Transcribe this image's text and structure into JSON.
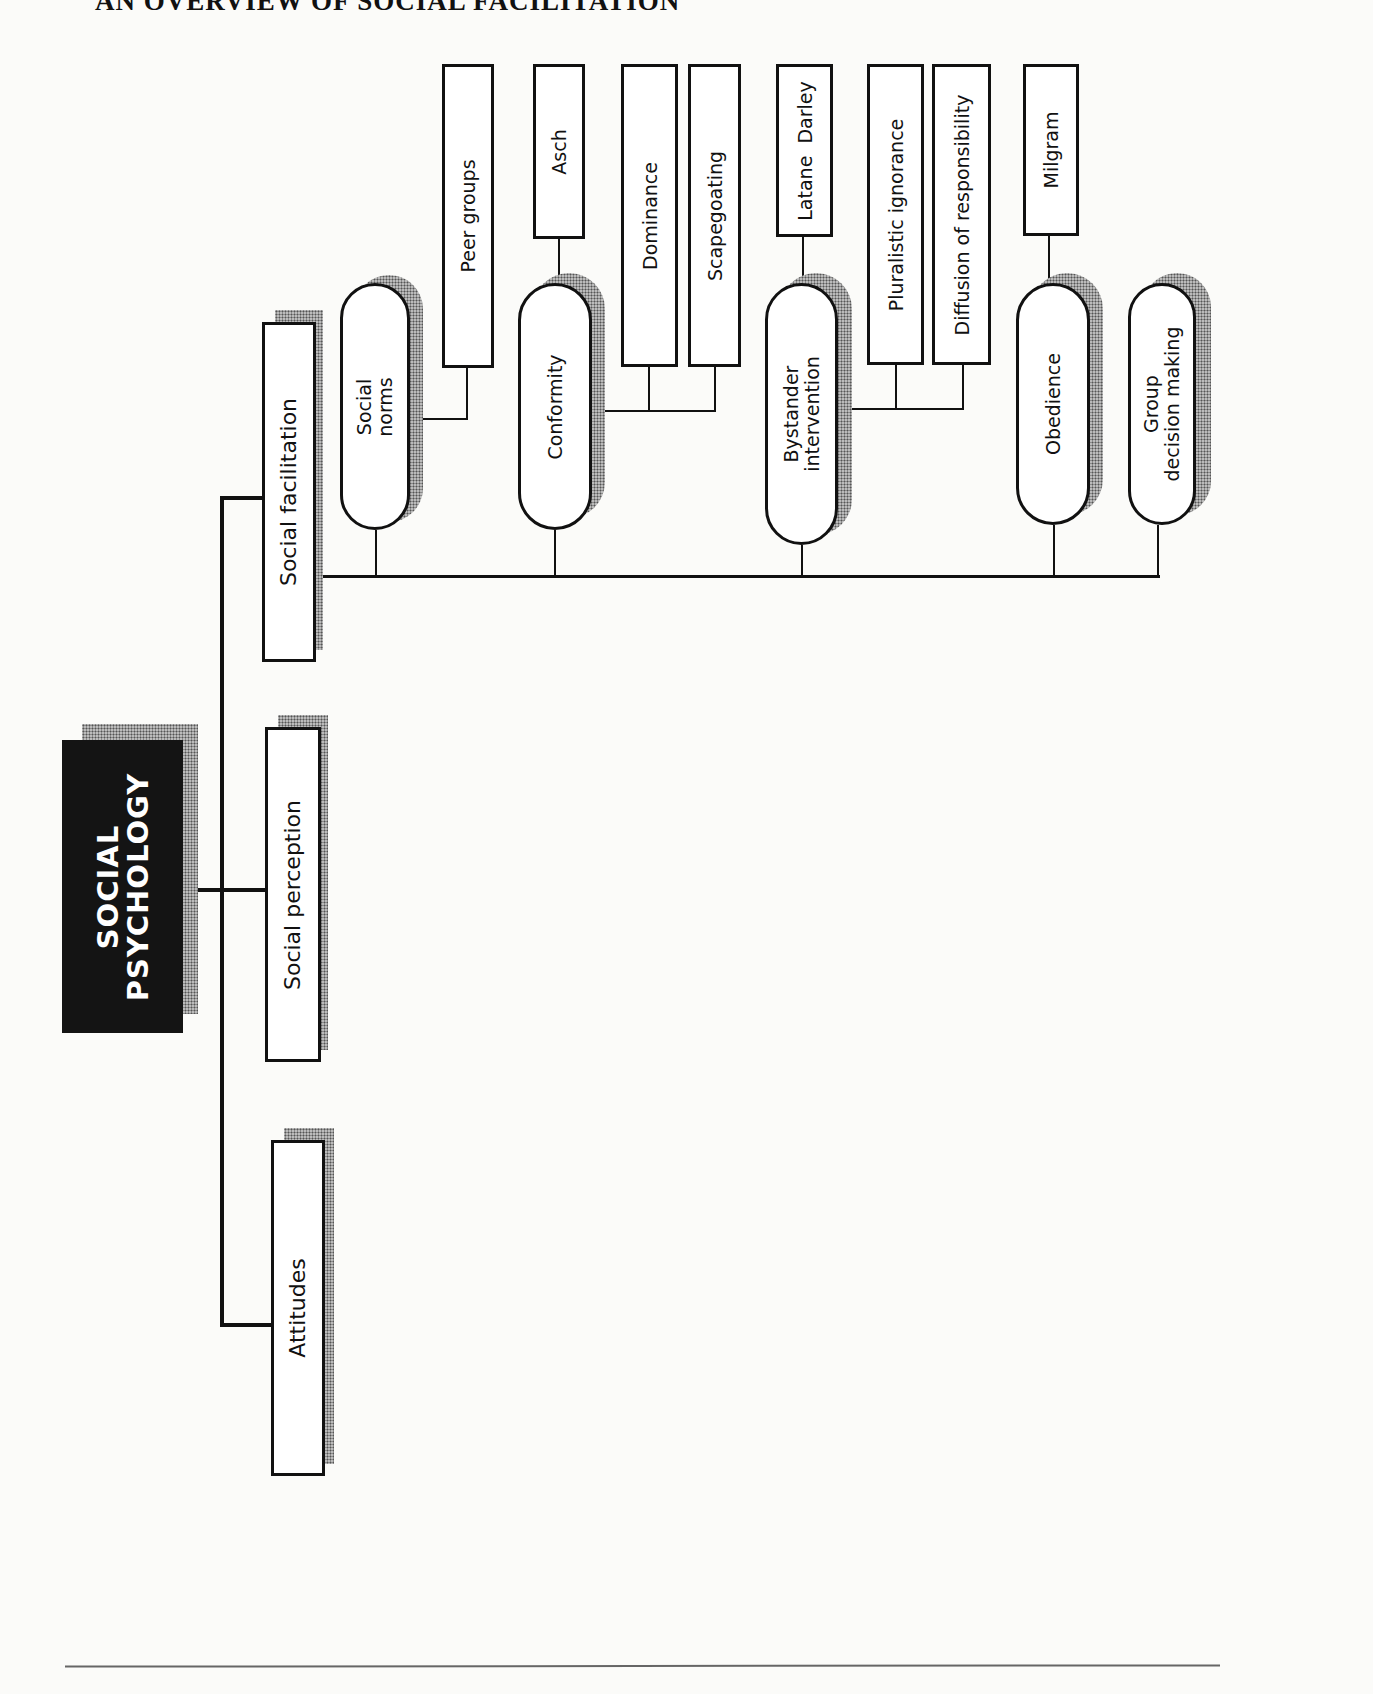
{
  "page": {
    "title": "AN OVERVIEW OF SOCIAL FACILITATION"
  },
  "diagram": {
    "root": {
      "label_line1": "SOCIAL",
      "label_line2": "PSYCHOLOGY"
    },
    "level1": [
      {
        "id": "social-facilitation",
        "label": "Social facilitation"
      },
      {
        "id": "social-perception",
        "label": "Social perception"
      },
      {
        "id": "attitudes",
        "label": "Attitudes"
      }
    ],
    "level2": [
      {
        "id": "social-norms",
        "label_line1": "Social",
        "label_line2": "norms",
        "parent": "social-facilitation"
      },
      {
        "id": "conformity",
        "label": "Conformity",
        "parent": "social-facilitation"
      },
      {
        "id": "bystander-intervention",
        "label_line1": "Bystander",
        "label_line2": "intervention",
        "parent": "social-facilitation"
      },
      {
        "id": "obedience",
        "label": "Obedience",
        "parent": "social-facilitation"
      },
      {
        "id": "group-decision-making",
        "label_line1": "Group",
        "label_line2": "decision making",
        "parent": "social-facilitation"
      }
    ],
    "level3": [
      {
        "id": "peer-groups",
        "label": "Peer groups",
        "parent": "social-norms"
      },
      {
        "id": "asch",
        "label": "Asch",
        "parent": "conformity"
      },
      {
        "id": "dominance",
        "label": "Dominance",
        "parent": "conformity"
      },
      {
        "id": "scapegoating",
        "label": "Scapegoating",
        "parent": "conformity"
      },
      {
        "id": "latane-darley",
        "label": "Latane  Darley",
        "parent": "bystander-intervention"
      },
      {
        "id": "pluralistic-ignorance",
        "label": "Pluralistic ignorance",
        "parent": "bystander-intervention"
      },
      {
        "id": "diffusion-of-responsibility",
        "label": "Diffusion of responsibility",
        "parent": "bystander-intervention"
      },
      {
        "id": "milgram",
        "label": "Milgram",
        "parent": "obedience"
      }
    ]
  },
  "colors": {
    "root_fill": "#141414",
    "root_text": "#ffffff",
    "node_border": "#111111",
    "shadow_stipple": "#555555"
  }
}
